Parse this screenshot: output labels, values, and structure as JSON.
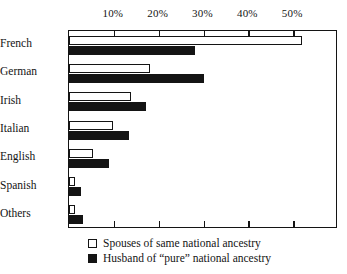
{
  "chart_data": {
    "type": "bar",
    "orientation": "horizontal",
    "title": "",
    "xlabel": "",
    "ylabel": "",
    "xlim": [
      0,
      60
    ],
    "grid": false,
    "legend_position": "bottom",
    "axis_ticks_top": true,
    "axis_ticks_bottom": true,
    "tick_labels": [
      "10%",
      "20%",
      "30%",
      "40%",
      "50%"
    ],
    "tick_values": [
      10,
      20,
      30,
      40,
      50
    ],
    "categories": [
      "French",
      "German",
      "Irish",
      "Italian",
      "English",
      "Spanish",
      "Others"
    ],
    "series": [
      {
        "name": "Spouses of same national ancestry",
        "style": "open",
        "color": "#ffffff",
        "values": [
          52.0,
          18.0,
          13.8,
          9.8,
          5.3,
          1.4,
          1.4
        ]
      },
      {
        "name": "Husband of “pure” national ancestry",
        "style": "solid",
        "color": "#141414",
        "values": [
          28.2,
          30.2,
          17.2,
          13.4,
          8.9,
          2.7,
          3.1
        ]
      }
    ]
  },
  "legend": {
    "items": [
      {
        "label": "Spouses of same national ancestry",
        "style": "open"
      },
      {
        "label": "Husband of “pure” national ancestry",
        "style": "solid"
      }
    ]
  }
}
